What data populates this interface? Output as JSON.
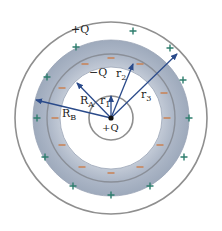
{
  "diagram": {
    "center": {
      "x": 111,
      "y": 118
    },
    "radii": {
      "inner_circle": 22,
      "shell_inner": 51,
      "shell_mid": 64,
      "shell_outer": 78,
      "outer_circle": 96
    },
    "colors": {
      "shell_fill": "#b3bccb",
      "shell_fill_light": "#d7dde6",
      "circle_stroke": "#8f8f8f",
      "arrow": "#2a4a8a",
      "plus": "#2e7d6d",
      "minus": "#c8855a",
      "text": "#222222"
    },
    "labels": {
      "outer_charge": "+Q",
      "inner_shell_charge": "−Q",
      "center_charge": "+Q",
      "r1": "r",
      "r1_sub": "1",
      "r2": "r",
      "r2_sub": "2",
      "r3": "r",
      "r3_sub": "3",
      "RA": "R",
      "RA_sub": "A",
      "RB": "R",
      "RB_sub": "B"
    },
    "arrows": [
      {
        "name": "r1",
        "to": {
          "x": 111,
          "y": 96
        }
      },
      {
        "name": "r2",
        "to": {
          "x": 133,
          "y": 64
        }
      },
      {
        "name": "r3",
        "to": {
          "x": 177,
          "y": 54
        }
      },
      {
        "name": "RA",
        "to": {
          "x": 77,
          "y": 83
        }
      },
      {
        "name": "RB",
        "to": {
          "x": 36,
          "y": 100
        }
      }
    ],
    "plus_signs": [
      {
        "x": 76,
        "y": 47
      },
      {
        "x": 133,
        "y": 31
      },
      {
        "x": 170,
        "y": 48
      },
      {
        "x": 47,
        "y": 77
      },
      {
        "x": 37,
        "y": 118
      },
      {
        "x": 183,
        "y": 80
      },
      {
        "x": 189,
        "y": 118
      },
      {
        "x": 45,
        "y": 157
      },
      {
        "x": 184,
        "y": 157
      },
      {
        "x": 73,
        "y": 186
      },
      {
        "x": 111,
        "y": 195
      },
      {
        "x": 150,
        "y": 186
      }
    ],
    "minus_signs": [
      {
        "x": 85,
        "y": 64
      },
      {
        "x": 111,
        "y": 58
      },
      {
        "x": 140,
        "y": 64
      },
      {
        "x": 62,
        "y": 88
      },
      {
        "x": 55,
        "y": 118
      },
      {
        "x": 164,
        "y": 93
      },
      {
        "x": 167,
        "y": 118
      },
      {
        "x": 62,
        "y": 145
      },
      {
        "x": 160,
        "y": 145
      },
      {
        "x": 82,
        "y": 167
      },
      {
        "x": 111,
        "y": 173
      },
      {
        "x": 140,
        "y": 167
      }
    ]
  }
}
